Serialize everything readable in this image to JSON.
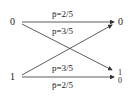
{
  "diagram": {
    "type": "binary-channel",
    "inputs": [
      {
        "id": "in0",
        "label": "0"
      },
      {
        "id": "in1",
        "label": "1"
      }
    ],
    "outputs": [
      {
        "id": "out0",
        "label": "0"
      },
      {
        "id": "out1_top",
        "label": "1"
      },
      {
        "id": "out1_bottom",
        "label": "0"
      }
    ],
    "edges": [
      {
        "from": "in0",
        "to": "out0",
        "label": "p̄=2/5"
      },
      {
        "from": "in0",
        "to": "out1",
        "label": "p=3/5"
      },
      {
        "from": "in1",
        "to": "out0",
        "label": "p=3/5"
      },
      {
        "from": "in1",
        "to": "out1",
        "label": "p̄=2/5"
      }
    ],
    "colors": {
      "line": "#333333",
      "text": "#222222"
    }
  }
}
